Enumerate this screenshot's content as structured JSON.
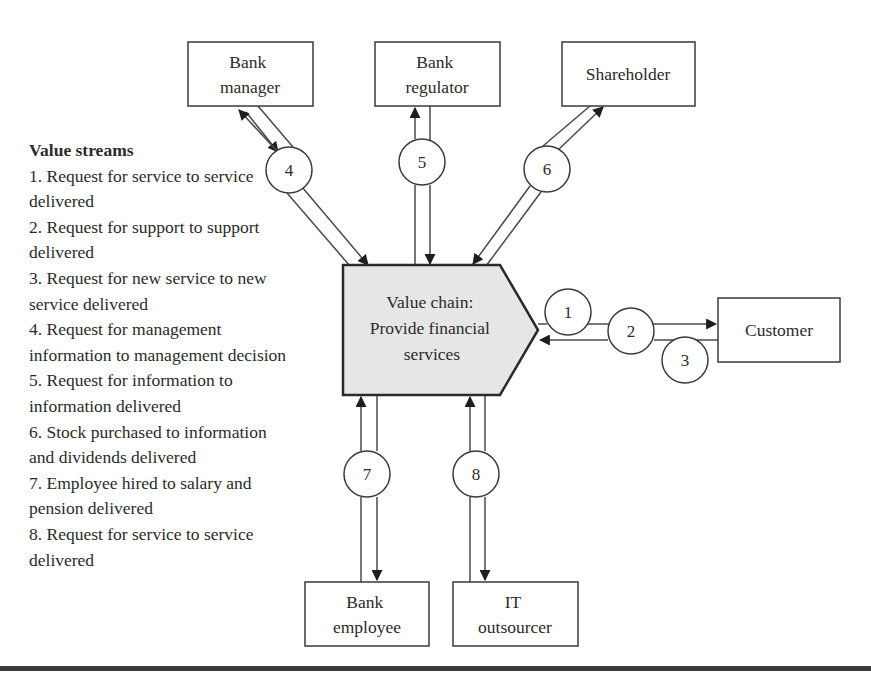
{
  "legend": {
    "title": "Value streams",
    "items": [
      "1. Request for service to service delivered",
      "2. Request for support to support delivered",
      "3. Request for new service to new service delivered",
      "4. Request for management information to management decision",
      "5. Request for information to information delivered",
      "6. Stock purchased to information and dividends delivered",
      "7. Employee hired to salary and pension delivered",
      "8. Request for service to service delivered"
    ]
  },
  "center": {
    "lines": [
      "Value chain:",
      "Provide financial",
      "services"
    ],
    "fill": "#e6e6e6"
  },
  "stakeholders": {
    "bank_manager": {
      "lines": [
        "Bank",
        "manager"
      ]
    },
    "bank_regulator": {
      "lines": [
        "Bank",
        "regulator"
      ]
    },
    "shareholder": {
      "lines": [
        "Shareholder"
      ]
    },
    "customer": {
      "lines": [
        "Customer"
      ]
    },
    "bank_employee": {
      "lines": [
        "Bank",
        "employee"
      ]
    },
    "it_outsourcer": {
      "lines": [
        "IT",
        "outsourcer"
      ]
    }
  },
  "streams": {
    "s1": "1",
    "s2": "2",
    "s3": "3",
    "s4": "4",
    "s5": "5",
    "s6": "6",
    "s7": "7",
    "s8": "8"
  },
  "colors": {
    "stroke": "#3a3a3a",
    "text": "#2b2b2b",
    "center_fill": "#e6e6e6"
  }
}
